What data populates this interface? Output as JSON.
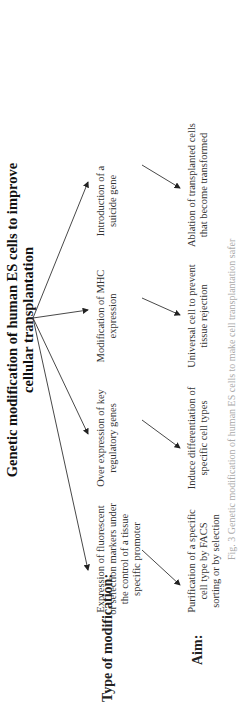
{
  "title": "Genetic modification of human ES cells to improve cellular transplantation",
  "title_lines": [
    "Genetic modification of human ES cells to improve",
    "cellular transplantation"
  ],
  "row_labels": {
    "type": "Type of modification:",
    "aim": "Aim:"
  },
  "modifications": [
    {
      "type": "Expression of fluorescent or selection markers under the control of a tissue specific promoter",
      "aim": "Purification of a specific cell type by FACS sorting or by selection"
    },
    {
      "type": "Over expression of key regulatory genes",
      "aim": "Induce differentiation of specific cell types"
    },
    {
      "type": "Modification of MHC expression",
      "aim": "Universal cell to prevent tissue rejection"
    },
    {
      "type": "Introduction of a suicide gene",
      "aim": "Ablation of transplanted cells that become transformed"
    }
  ],
  "caption": "Fig. 3 Genetic modification of human ES cells to make cell transplantation safer"
}
